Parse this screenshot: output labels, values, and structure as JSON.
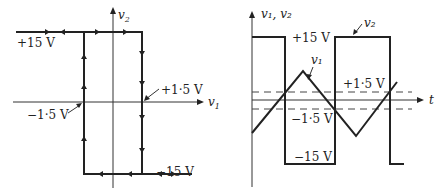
{
  "left_diagram": {
    "title": "Hysteresis transfer characteristic",
    "x_axis_label": "v",
    "x_axis_sub": "1",
    "y_axis_label": "v",
    "y_axis_sub": "2",
    "labels": {
      "upper_level": "+15 V",
      "lower_level": "−15 V",
      "upper_threshold": "+1·5 V",
      "lower_threshold": "−1·5 V"
    }
  },
  "right_diagram": {
    "title": "Waveforms vs time",
    "y_axis_label": "v₁, v₂",
    "x_axis_label": "t",
    "curve_labels": {
      "square": "v₂",
      "triangle": "v₁"
    },
    "labels": {
      "upper_level": "+15 V",
      "lower_level": "−15 V",
      "upper_threshold": "+1·5 V",
      "lower_threshold": "−1·5 V"
    }
  }
}
